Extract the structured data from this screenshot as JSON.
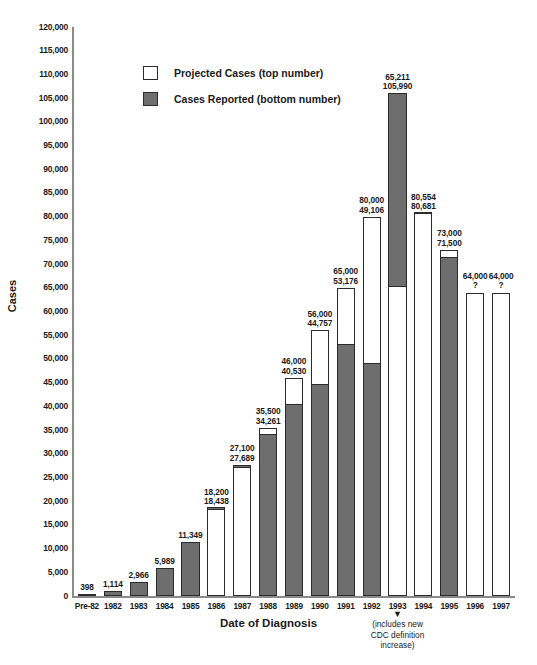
{
  "chart_data": {
    "type": "bar",
    "title": "",
    "xlabel": "Date of Diagnosis",
    "ylabel": "Cases",
    "ylim": [
      0,
      120000
    ],
    "ytick_step": 5000,
    "grid": false,
    "legend_position": "top-left",
    "categories": [
      "Pre-82",
      "1982",
      "1983",
      "1984",
      "1985",
      "1986",
      "1987",
      "1988",
      "1989",
      "1990",
      "1991",
      "1992",
      "1993",
      "1994",
      "1995",
      "1996",
      "1997"
    ],
    "series": [
      {
        "name": "Projected Cases (top number)",
        "values": [
          null,
          null,
          null,
          null,
          null,
          18200,
          27100,
          35500,
          46000,
          56000,
          65000,
          80000,
          65211,
          80554,
          73000,
          64000,
          64000
        ]
      },
      {
        "name": "Cases Reported (bottom number)",
        "values": [
          398,
          1114,
          2966,
          5989,
          11349,
          18438,
          27689,
          34261,
          40530,
          44757,
          53176,
          49106,
          105990,
          80681,
          71500,
          null,
          null
        ]
      }
    ],
    "point_labels": [
      {
        "category": "Pre-82",
        "projected": "",
        "reported": "398"
      },
      {
        "category": "1982",
        "projected": "",
        "reported": "1,114"
      },
      {
        "category": "1983",
        "projected": "",
        "reported": "2,966"
      },
      {
        "category": "1984",
        "projected": "",
        "reported": "5,989"
      },
      {
        "category": "1985",
        "projected": "",
        "reported": "11,349"
      },
      {
        "category": "1986",
        "projected": "18,200",
        "reported": "18,438"
      },
      {
        "category": "1987",
        "projected": "27,100",
        "reported": "27,689"
      },
      {
        "category": "1988",
        "projected": "35,500",
        "reported": "34,261"
      },
      {
        "category": "1989",
        "projected": "46,000",
        "reported": "40,530"
      },
      {
        "category": "1990",
        "projected": "56,000",
        "reported": "44,757"
      },
      {
        "category": "1991",
        "projected": "65,000",
        "reported": "53,176"
      },
      {
        "category": "1992",
        "projected": "80,000",
        "reported": "49,106"
      },
      {
        "category": "1993",
        "projected": "65,211",
        "reported": "105,990"
      },
      {
        "category": "1994",
        "projected": "80,554",
        "reported": "80,681"
      },
      {
        "category": "1995",
        "projected": "73,000",
        "reported": "71,500"
      },
      {
        "category": "1996",
        "projected": "64,000",
        "reported": "?"
      },
      {
        "category": "1997",
        "projected": "64,000",
        "reported": "?"
      }
    ],
    "ytick_labels": [
      "120,000",
      "115,000",
      "110,000",
      "105,000",
      "100,000",
      "95,000",
      "90,000",
      "85,000",
      "80,000",
      "75,000",
      "70,000",
      "65,000",
      "60,000",
      "55,000",
      "50,000",
      "45,000",
      "40,000",
      "35,000",
      "30,000",
      "25,000",
      "20,000",
      "15,000",
      "10,000",
      "5,000",
      "0"
    ],
    "annotations": [
      {
        "name": "cdc-definition-note",
        "target_category": "1993",
        "arrow": "▼",
        "lines": [
          "(includes new",
          "CDC definition",
          "increase)"
        ]
      }
    ],
    "colors": {
      "reported_fill": "#6e6e6e",
      "projected_fill": "#ffffff",
      "bar_outline": "#2b2b2b",
      "axis": "#8a8a8a",
      "text": "#1a1a1a"
    }
  },
  "legend": {
    "items": [
      {
        "label": "Projected Cases (top number)",
        "swatch": "open"
      },
      {
        "label": "Cases Reported (bottom number)",
        "swatch": "filled"
      }
    ]
  }
}
